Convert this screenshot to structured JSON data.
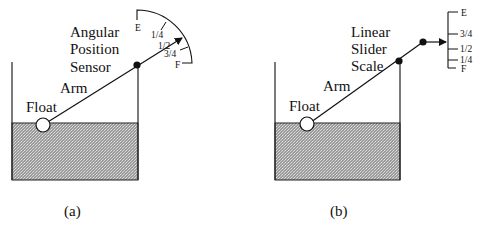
{
  "panels": [
    {
      "id": "a",
      "caption": "(a)",
      "sensor_label_lines": [
        "Angular",
        "Position",
        "Sensor"
      ],
      "arm_label": "Arm",
      "float_label": "Float",
      "scale_type": "angular",
      "scale_marks": [
        "E",
        "1/4",
        "1/2",
        "3/4",
        "F"
      ]
    },
    {
      "id": "b",
      "caption": "(b)",
      "sensor_label_lines": [
        "Linear",
        "Slider",
        "Scale"
      ],
      "arm_label": "Arm",
      "float_label": "Float",
      "scale_type": "linear",
      "scale_marks": [
        "E",
        "3/4",
        "1/2",
        "1/4",
        "F"
      ]
    }
  ],
  "colors": {
    "line": "#1a1a1a",
    "liquid_fill": "#a8a8a8",
    "liquid_dot": "#e6e6e6",
    "background": "#ffffff"
  }
}
